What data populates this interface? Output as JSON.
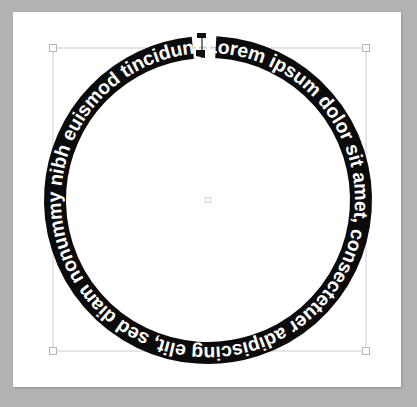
{
  "app": {
    "canvas_background": "#b2b2b2",
    "page_background": "#ffffff"
  },
  "artwork": {
    "name": "circular-text-object",
    "type": "text-on-path",
    "path_shape": "circle",
    "text": "Lorem ipsum dolor sit amet, consectetuer adipiscing elit, sed diam nonummy nibh euismod tincidunt ut laoreet dolore magna aliquam erat",
    "text_fill_color": "#ffffff",
    "band_fill_color": "#0b0b0b",
    "font_weight": "bold",
    "font_size_px": 19.4,
    "start_angle_deg": -88,
    "center_x": 208,
    "center_y": 200,
    "radius_px": 153,
    "band_thickness_px": 22
  },
  "selection": {
    "bounds": {
      "left": 53,
      "top": 48,
      "right": 366,
      "bottom": 351,
      "width": 313,
      "height": 303
    },
    "handles": [
      {
        "name": "handle-top-left",
        "x": 53,
        "y": 48
      },
      {
        "name": "handle-top-right",
        "x": 366,
        "y": 48
      },
      {
        "name": "handle-bottom-left",
        "x": 53,
        "y": 351
      },
      {
        "name": "handle-bottom-right",
        "x": 366,
        "y": 351
      }
    ],
    "handle_fill": "#fdfdfd",
    "handle_stroke": "#b4b7bb",
    "bbox_stroke": "#c9ccd0"
  },
  "center_point": {
    "name": "object-center-marker",
    "x": 208,
    "y": 200
  },
  "path_start_marker": {
    "name": "text-path-start-bracket",
    "x": 201,
    "y": 44
  }
}
